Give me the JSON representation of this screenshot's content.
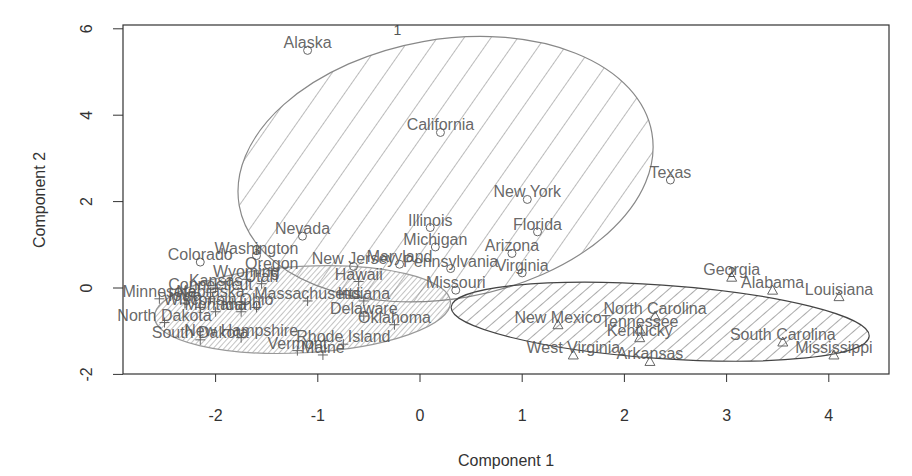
{
  "chart_data": {
    "type": "scatter",
    "title": "",
    "xlabel": "Component 1",
    "ylabel": "Component 2",
    "xlim": [
      -2.95,
      4.55
    ],
    "ylim": [
      -2.0,
      6.05
    ],
    "xticks": [
      -2,
      -1,
      0,
      1,
      2,
      3,
      4
    ],
    "yticks": [
      -2,
      0,
      2,
      4,
      6
    ],
    "grid": false,
    "legend": "none",
    "clusters": [
      {
        "id": 1,
        "label": "1",
        "symbol": "circle",
        "hatch": "wide diagonal",
        "ellipse": {
          "cx": 0.25,
          "cy": 2.75,
          "rx": 2.05,
          "ry": 3.0,
          "angle_deg": -10
        },
        "label_pos": [
          -0.22,
          5.95
        ],
        "points": [
          {
            "name": "Alaska",
            "x": -1.1,
            "y": 5.5
          },
          {
            "name": "California",
            "x": 0.2,
            "y": 3.6
          },
          {
            "name": "Texas",
            "x": 2.45,
            "y": 2.5
          },
          {
            "name": "New York",
            "x": 1.05,
            "y": 2.05
          },
          {
            "name": "Florida",
            "x": 1.15,
            "y": 1.3
          },
          {
            "name": "Nevada",
            "x": -1.15,
            "y": 1.2
          },
          {
            "name": "Illinois",
            "x": 0.1,
            "y": 1.4
          },
          {
            "name": "Michigan",
            "x": 0.15,
            "y": 0.95
          },
          {
            "name": "Arizona",
            "x": 0.9,
            "y": 0.8
          },
          {
            "name": "Maryland",
            "x": -0.2,
            "y": 0.55
          },
          {
            "name": "Pennsylvania",
            "x": 0.3,
            "y": 0.45
          },
          {
            "name": "Virginia",
            "x": 1.0,
            "y": 0.35
          },
          {
            "name": "Missouri",
            "x": 0.35,
            "y": -0.05
          },
          {
            "name": "New Jersey",
            "x": -0.65,
            "y": 0.5
          },
          {
            "name": "Colorado",
            "x": -2.15,
            "y": 0.6
          },
          {
            "name": "Washington",
            "x": -1.6,
            "y": 0.75
          }
        ]
      },
      {
        "id": 2,
        "label": "2",
        "symbol": "triangle",
        "hatch": "medium diagonal",
        "ellipse": {
          "cx": 2.35,
          "cy": -0.78,
          "rx": 2.05,
          "ry": 0.85,
          "angle_deg": 4
        },
        "label_pos": [
          3.05,
          0.35
        ],
        "points": [
          {
            "name": "Georgia",
            "x": 3.05,
            "y": 0.25
          },
          {
            "name": "Alabama",
            "x": 3.45,
            "y": -0.05
          },
          {
            "name": "Louisiana",
            "x": 4.1,
            "y": -0.2
          },
          {
            "name": "New Mexico",
            "x": 1.35,
            "y": -0.85
          },
          {
            "name": "North Carolina",
            "x": 2.3,
            "y": -0.65
          },
          {
            "name": "Tennessee",
            "x": 2.15,
            "y": -0.95
          },
          {
            "name": "South Carolina",
            "x": 3.55,
            "y": -1.25
          },
          {
            "name": "Mississippi",
            "x": 4.05,
            "y": -1.55
          },
          {
            "name": "Kentucky",
            "x": 2.15,
            "y": -1.15
          },
          {
            "name": "Arkansas",
            "x": 2.25,
            "y": -1.7
          },
          {
            "name": "West Virginia",
            "x": 1.5,
            "y": -1.55
          }
        ]
      },
      {
        "id": 3,
        "label": "3",
        "symbol": "plus",
        "hatch": "dense diagonal",
        "ellipse": {
          "cx": -1.15,
          "cy": -0.5,
          "rx": 1.45,
          "ry": 1.0,
          "angle_deg": -3
        },
        "label_pos": [
          -1.6,
          0.85
        ],
        "points": [
          {
            "name": "Oregon",
            "x": -1.45,
            "y": 0.4
          },
          {
            "name": "Wyoming",
            "x": -1.7,
            "y": 0.2
          },
          {
            "name": "Utah",
            "x": -1.55,
            "y": 0.1
          },
          {
            "name": "Kansas",
            "x": -2.0,
            "y": 0.0
          },
          {
            "name": "Nebraska",
            "x": -2.05,
            "y": -0.25
          },
          {
            "name": "Connecticut",
            "x": -2.05,
            "y": -0.1
          },
          {
            "name": "Massachusetts",
            "x": -1.1,
            "y": -0.3
          },
          {
            "name": "Indiana",
            "x": -0.55,
            "y": -0.3
          },
          {
            "name": "Hawaii",
            "x": -0.6,
            "y": 0.15
          },
          {
            "name": "Delaware",
            "x": -0.55,
            "y": -0.65
          },
          {
            "name": "Oklahoma",
            "x": -0.25,
            "y": -0.85
          },
          {
            "name": "Montana",
            "x": -2.0,
            "y": -0.55
          },
          {
            "name": "Idaho",
            "x": -1.75,
            "y": -0.55
          },
          {
            "name": "Iowa",
            "x": -2.3,
            "y": -0.35
          },
          {
            "name": "Wisconsin",
            "x": -2.15,
            "y": -0.45
          },
          {
            "name": "Minnesota",
            "x": -2.55,
            "y": -0.25
          },
          {
            "name": "North Dakota",
            "x": -2.5,
            "y": -0.8
          },
          {
            "name": "South Dakota",
            "x": -2.15,
            "y": -1.2
          },
          {
            "name": "Ohio",
            "x": -1.6,
            "y": -0.45
          },
          {
            "name": "New Hampshire",
            "x": -1.75,
            "y": -1.15
          },
          {
            "name": "Vermont",
            "x": -1.2,
            "y": -1.45
          },
          {
            "name": "Rhode Island",
            "x": -0.75,
            "y": -1.3
          },
          {
            "name": "Maine",
            "x": -0.95,
            "y": -1.55
          }
        ]
      }
    ]
  }
}
